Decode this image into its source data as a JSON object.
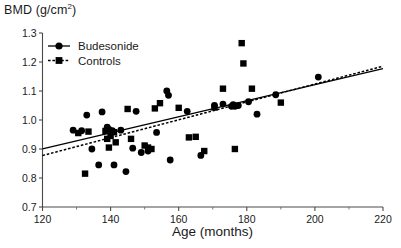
{
  "chart_data": {
    "type": "scatter",
    "title": "",
    "ylabel": "BMD (g/cm2)",
    "ylabel_base": "BMD (g/cm",
    "ylabel_sup": "2",
    "ylabel_tail": ")",
    "xlabel": "Age (months)",
    "xlim": [
      120,
      220
    ],
    "ylim": [
      0.7,
      1.3
    ],
    "xticks": [
      120,
      140,
      160,
      180,
      200,
      220
    ],
    "xtick_labels": [
      "120",
      "140",
      "160",
      "180",
      "200",
      "220"
    ],
    "yticks": [
      0.7,
      0.8,
      0.9,
      1.0,
      1.1,
      1.2,
      1.3
    ],
    "ytick_labels": [
      "0.7",
      "0.8",
      "0.9",
      "1.0",
      "1.1",
      "1.2",
      "1.3"
    ],
    "xminor_step": 10,
    "grid": false,
    "legend_position": "top-left",
    "legend": [
      {
        "name": "Budesonide",
        "marker": "circle",
        "line": "solid"
      },
      {
        "name": "Controls",
        "marker": "square",
        "line": "dashed"
      }
    ],
    "series": [
      {
        "name": "Budesonide",
        "marker": "circle",
        "line": "solid",
        "points": [
          [
            129.0,
            0.965
          ],
          [
            131.5,
            0.963
          ],
          [
            133.0,
            1.017
          ],
          [
            134.5,
            0.9
          ],
          [
            136.5,
            0.845
          ],
          [
            137.5,
            1.028
          ],
          [
            139.0,
            0.975
          ],
          [
            139.5,
            0.968
          ],
          [
            140.5,
            0.963
          ],
          [
            141.0,
            0.845
          ],
          [
            143.0,
            0.965
          ],
          [
            144.5,
            0.822
          ],
          [
            146.5,
            0.903
          ],
          [
            147.5,
            1.03
          ],
          [
            149.0,
            0.888
          ],
          [
            151.0,
            0.893
          ],
          [
            153.5,
            0.957
          ],
          [
            156.5,
            1.1
          ],
          [
            157.0,
            1.085
          ],
          [
            157.5,
            0.862
          ],
          [
            162.5,
            1.03
          ],
          [
            166.5,
            0.878
          ],
          [
            170.5,
            1.05
          ],
          [
            173.0,
            1.055
          ],
          [
            175.5,
            1.047
          ],
          [
            176.0,
            1.053
          ],
          [
            176.5,
            1.047
          ],
          [
            177.5,
            1.05
          ],
          [
            180.5,
            1.063
          ],
          [
            183.0,
            1.02
          ],
          [
            188.5,
            1.087
          ],
          [
            201.0,
            1.148
          ]
        ]
      },
      {
        "name": "Controls",
        "marker": "square",
        "line": "dashed",
        "points": [
          [
            130.5,
            0.955
          ],
          [
            132.5,
            0.815
          ],
          [
            133.5,
            0.96
          ],
          [
            138.5,
            0.962
          ],
          [
            139.0,
            0.935
          ],
          [
            139.5,
            0.905
          ],
          [
            140.0,
            0.945
          ],
          [
            141.0,
            0.958
          ],
          [
            141.5,
            0.923
          ],
          [
            145.0,
            1.038
          ],
          [
            146.0,
            0.935
          ],
          [
            150.0,
            0.912
          ],
          [
            151.0,
            0.905
          ],
          [
            152.0,
            0.9
          ],
          [
            153.0,
            1.04
          ],
          [
            154.5,
            1.058
          ],
          [
            160.0,
            1.042
          ],
          [
            163.0,
            0.94
          ],
          [
            165.0,
            0.942
          ],
          [
            167.5,
            0.893
          ],
          [
            170.5,
            1.043
          ],
          [
            173.0,
            1.108
          ],
          [
            176.5,
            0.9
          ],
          [
            178.5,
            1.265
          ],
          [
            179.0,
            1.195
          ],
          [
            181.5,
            1.108
          ],
          [
            190.0,
            1.06
          ]
        ]
      }
    ],
    "fit_lines": [
      {
        "series": "Budesonide",
        "style": "solid",
        "x": [
          120,
          220
        ],
        "y": [
          0.9005,
          1.1775
        ]
      },
      {
        "series": "Controls",
        "style": "dashed",
        "x": [
          120,
          220
        ],
        "y": [
          0.8775,
          1.1855
        ]
      }
    ]
  },
  "axis": {
    "y_title_base": "BMD (g/cm",
    "y_title_sup": "2",
    "y_title_tail": ")",
    "x_title": "Age (months)"
  }
}
